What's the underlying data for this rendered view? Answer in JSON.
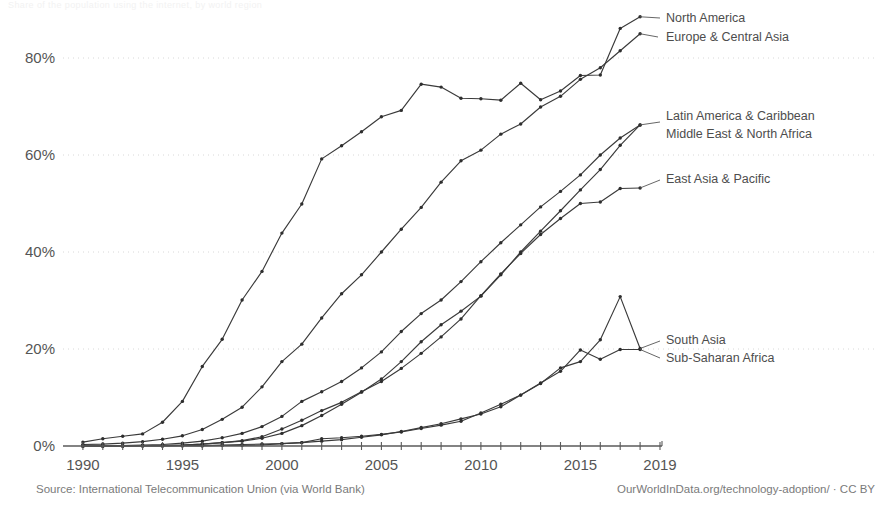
{
  "title_fragment": "Share of the population using the internet, by world region",
  "footer": {
    "source": "Source: International Telecommunication Union (via World Bank)",
    "credit": "OurWorldInData.org/technology-adoption/ · CC BY"
  },
  "axes": {
    "ylabel": "",
    "xlabel": "",
    "y_ticks": [
      "0%",
      "20%",
      "40%",
      "60%",
      "80%"
    ],
    "x_ticks": [
      "1990",
      "1995",
      "2000",
      "2005",
      "2010",
      "2015",
      "2019"
    ]
  },
  "annotations": [
    {
      "name": "north-america",
      "text": "North America",
      "x": 666,
      "y": 22
    },
    {
      "name": "europe-central-asia",
      "text": "Europe & Central Asia",
      "x": 666,
      "y": 41
    },
    {
      "name": "latin-america-caribbean",
      "text": "Latin America & Caribbean",
      "x": 666,
      "y": 120
    },
    {
      "name": "middle-east-north-africa",
      "text": "Middle East & North Africa",
      "x": 666,
      "y": 138
    },
    {
      "name": "east-asia-pacific",
      "text": "East Asia & Pacific",
      "x": 666,
      "y": 183
    },
    {
      "name": "south-asia",
      "text": "South Asia",
      "x": 666,
      "y": 344
    },
    {
      "name": "sub-saharan-africa",
      "text": "Sub-Saharan Africa",
      "x": 666,
      "y": 362
    }
  ],
  "chart_data": {
    "type": "line",
    "title": "Share of the population using the internet, by world region",
    "xlabel": "",
    "ylabel": "",
    "xlim": [
      1989,
      2019
    ],
    "ylim": [
      0,
      90
    ],
    "grid": true,
    "legend_position": "right-inline-labels",
    "x": [
      1990,
      1991,
      1992,
      1993,
      1994,
      1995,
      1996,
      1997,
      1998,
      1999,
      2000,
      2001,
      2002,
      2003,
      2004,
      2005,
      2006,
      2007,
      2008,
      2009,
      2010,
      2011,
      2012,
      2013,
      2014,
      2015,
      2016,
      2017,
      2018
    ],
    "series": [
      {
        "name": "North America",
        "values": [
          0.8,
          1.5,
          2.0,
          2.5,
          4.9,
          9.2,
          16.4,
          22.0,
          30.1,
          36.0,
          43.9,
          49.9,
          59.2,
          61.9,
          64.8,
          67.9,
          69.2,
          74.6,
          74.0,
          71.7,
          71.6,
          71.3,
          74.8,
          71.4,
          73.2,
          76.4,
          76.5,
          86.1,
          88.5
        ]
      },
      {
        "name": "Europe & Central Asia",
        "values": [
          0.3,
          0.4,
          0.6,
          0.9,
          1.4,
          2.1,
          3.4,
          5.5,
          8.0,
          12.2,
          17.4,
          21.0,
          26.4,
          31.4,
          35.3,
          40.0,
          44.7,
          49.2,
          54.4,
          58.8,
          61.0,
          64.3,
          66.4,
          69.9,
          72.1,
          75.6,
          78.0,
          81.5,
          85.0
        ]
      },
      {
        "name": "Latin America & Caribbean",
        "values": [
          0.0,
          0.0,
          0.1,
          0.2,
          0.3,
          0.6,
          1.0,
          1.7,
          2.6,
          4.0,
          6.1,
          9.2,
          11.2,
          13.3,
          16.1,
          19.4,
          23.6,
          27.3,
          30.1,
          33.9,
          38.0,
          41.9,
          45.6,
          49.3,
          52.5,
          55.9,
          60.0,
          63.5,
          66.2
        ]
      },
      {
        "name": "Middle East & North Africa",
        "values": [
          0.0,
          0.0,
          0.0,
          0.1,
          0.1,
          0.2,
          0.4,
          0.7,
          1.0,
          1.6,
          2.6,
          4.2,
          6.3,
          8.6,
          11.1,
          13.8,
          17.4,
          21.5,
          25.0,
          27.8,
          30.9,
          35.3,
          40.0,
          44.3,
          48.5,
          52.8,
          57.0,
          62.0,
          66.2
        ]
      },
      {
        "name": "East Asia & Pacific",
        "values": [
          0.0,
          0.0,
          0.0,
          0.1,
          0.1,
          0.2,
          0.4,
          0.7,
          1.1,
          1.9,
          3.5,
          5.3,
          7.3,
          9.0,
          11.2,
          13.3,
          16.0,
          19.1,
          22.5,
          26.2,
          31.0,
          35.5,
          39.7,
          43.6,
          46.9,
          50.0,
          50.3,
          53.1,
          53.2
        ]
      },
      {
        "name": "South Asia",
        "values": [
          0.0,
          0.0,
          0.0,
          0.0,
          0.0,
          0.0,
          0.0,
          0.1,
          0.1,
          0.2,
          0.5,
          0.7,
          1.5,
          1.7,
          2.0,
          2.4,
          2.9,
          3.6,
          4.3,
          5.1,
          6.8,
          8.6,
          10.5,
          12.9,
          16.1,
          17.4,
          21.9,
          30.8,
          20.1
        ]
      },
      {
        "name": "Sub-Saharan Africa",
        "values": [
          0.0,
          0.0,
          0.0,
          0.0,
          0.0,
          0.1,
          0.1,
          0.2,
          0.3,
          0.4,
          0.5,
          0.7,
          1.0,
          1.3,
          1.8,
          2.3,
          3.0,
          3.8,
          4.6,
          5.6,
          6.6,
          8.1,
          10.5,
          13.0,
          15.4,
          19.8,
          17.9,
          19.9,
          19.9
        ]
      }
    ]
  }
}
